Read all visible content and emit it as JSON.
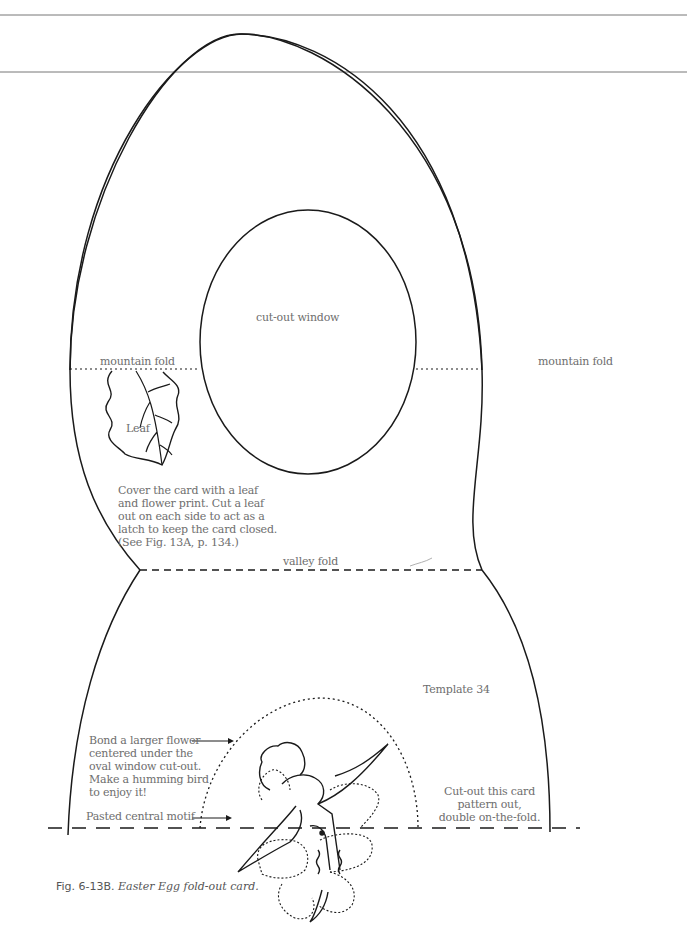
{
  "figure": {
    "caption_number": "Fig. 6-13B.",
    "caption_title": "Easter Egg fold-out card.",
    "template_label": "Template 34"
  },
  "labels": {
    "cutout_window": "cut-out window",
    "mountain_fold_left": "mountain fold",
    "mountain_fold_right": "mountain fold",
    "leaf": "Leaf",
    "valley_fold": "valley fold",
    "cover_instructions": "Cover the card with a leaf\nand flower print. Cut a leaf\nout on each side to act as a\nlatch to keep the card closed.\n(See Fig. 13A, p. 134.)",
    "bond_instructions": "Bond a larger flower\ncentered under the\noval window cut-out.\nMake a humming bird\nto enjoy it!",
    "pasted_motif": "Pasted central motif",
    "cutout_instructions": "Cut-out this card\npattern out,\ndouble on-the-fold."
  },
  "line_types": {
    "cut_line": "solid",
    "mountain_fold": "dotted",
    "valley_fold": "dashed",
    "center_fold": "long-dashed"
  },
  "colors": {
    "line": "#1a1a1a",
    "text": "#6e6e6e",
    "rule": "#777777"
  }
}
